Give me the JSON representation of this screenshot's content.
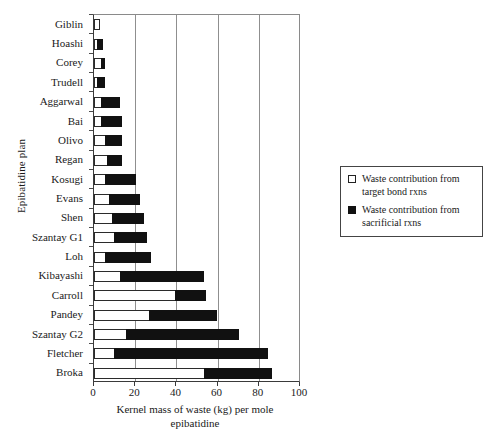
{
  "chart_data": {
    "type": "bar",
    "orientation": "horizontal",
    "stacked": true,
    "title": "",
    "xlabel": "Kernel mass of waste (kg) per mole epibatidine",
    "ylabel": "Epibatidine plan",
    "xlim": [
      0,
      100
    ],
    "xticks": [
      0,
      20,
      40,
      60,
      80,
      100
    ],
    "grid": "vertical",
    "legend_position": "right-outside",
    "categories": [
      "Giblin",
      "Hoashi",
      "Corey",
      "Trudell",
      "Aggarwal",
      "Bai",
      "Olivo",
      "Regan",
      "Kosugi",
      "Evans",
      "Shen",
      "Szantay G1",
      "Loh",
      "Kibayashi",
      "Carroll",
      "Pandey",
      "Szantay G2",
      "Fletcher",
      "Broka"
    ],
    "series": [
      {
        "name": "Waste contribution from target bond rxns",
        "color": "#ffffff",
        "values": [
          3,
          2,
          4,
          2,
          4,
          4,
          6,
          7,
          6,
          8,
          9,
          10,
          6,
          13,
          40,
          27,
          16,
          10,
          54
        ]
      },
      {
        "name": "Waste contribution from sacrificial rxns",
        "color": "#111111",
        "values": [
          0,
          3,
          2,
          4,
          9,
          10,
          8,
          7,
          15,
          15,
          16,
          16,
          22,
          41,
          15,
          33,
          55,
          75,
          33
        ]
      }
    ],
    "totals": [
      3,
      5,
      6,
      6,
      13,
      14,
      14,
      14,
      21,
      23,
      25,
      26,
      28,
      54,
      55,
      60,
      71,
      85,
      87
    ]
  },
  "legend": {
    "items": [
      {
        "swatch": "open-square",
        "label": "Waste contribution from target bond rxns"
      },
      {
        "swatch": "filled-square",
        "label": "Waste contribution from sacrificial rxns"
      }
    ]
  },
  "axis": {
    "y_title": "Epibatidine plan",
    "x_title_line1": "Kernel mass of waste (kg) per mole",
    "x_title_line2": "epibatidine"
  }
}
